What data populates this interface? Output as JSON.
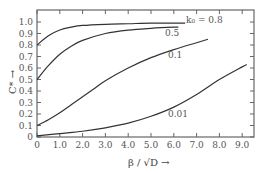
{
  "chart_data": {
    "type": "line",
    "title": "",
    "xlabel": "β / √D →",
    "ylabel": "C* →",
    "xlim": [
      0,
      9.5
    ],
    "ylim": [
      0,
      1.1
    ],
    "grid": false,
    "x_ticks": [
      "0",
      "1.0",
      "2.0",
      "3.0",
      "4.0",
      "5.0",
      "6.0",
      "7.0",
      "8.0",
      "9.0"
    ],
    "y_ticks": [
      "0",
      "0.1",
      "0.2",
      "0.3",
      "0.4",
      "0.5",
      "0.6",
      "0.7",
      "0.8",
      "0.9",
      "1.0"
    ],
    "series": [
      {
        "name": "k0 = 0.8",
        "label": "k₀ = 0.8",
        "x": [
          0,
          0.5,
          1.0,
          1.5,
          2.0,
          3.0,
          4.0,
          5.0,
          6.0,
          6.5
        ],
        "y": [
          0.8,
          0.88,
          0.93,
          0.955,
          0.97,
          0.98,
          0.985,
          0.99,
          0.99,
          0.99
        ]
      },
      {
        "name": "0.5",
        "label": "0.5",
        "x": [
          0,
          0.5,
          1.0,
          1.5,
          2.0,
          3.0,
          4.0,
          5.0,
          6.0,
          6.2
        ],
        "y": [
          0.5,
          0.62,
          0.72,
          0.79,
          0.84,
          0.9,
          0.93,
          0.945,
          0.955,
          0.955
        ]
      },
      {
        "name": "0.1",
        "label": "0.1",
        "x": [
          0,
          0.5,
          1.0,
          1.5,
          2.0,
          2.5,
          3.0,
          4.0,
          5.0,
          6.0,
          7.0,
          7.5
        ],
        "y": [
          0.1,
          0.15,
          0.21,
          0.28,
          0.35,
          0.42,
          0.49,
          0.6,
          0.69,
          0.76,
          0.82,
          0.85
        ]
      },
      {
        "name": "0.01",
        "label": "0.01",
        "x": [
          0,
          1.0,
          2.0,
          3.0,
          4.0,
          5.0,
          6.0,
          7.0,
          8.0,
          9.0,
          9.2
        ],
        "y": [
          0.01,
          0.03,
          0.05,
          0.08,
          0.12,
          0.18,
          0.26,
          0.37,
          0.5,
          0.61,
          0.63
        ]
      }
    ]
  }
}
